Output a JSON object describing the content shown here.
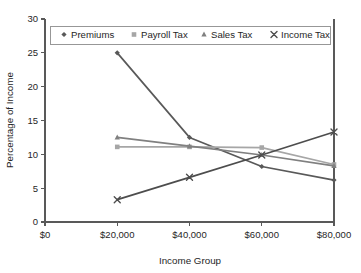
{
  "chart_data": {
    "type": "line",
    "title": "",
    "xlabel": "Income Group",
    "ylabel": "Percentage of Income",
    "x": [
      20000,
      40000,
      60000,
      80000
    ],
    "xtick_labels": [
      "$0",
      "$20,000",
      "$40,000",
      "$60,000",
      "$80,000"
    ],
    "xtick_values": [
      0,
      20000,
      40000,
      60000,
      80000
    ],
    "ytick_labels": [
      "0",
      "5",
      "10",
      "15",
      "20",
      "25",
      "30"
    ],
    "ytick_values": [
      0,
      5,
      10,
      15,
      20,
      25,
      30
    ],
    "xlim": [
      0,
      80000
    ],
    "ylim": [
      0,
      30
    ],
    "grid": false,
    "legend_position": "top-inside",
    "series": [
      {
        "name": "Premiums",
        "marker": "diamond",
        "color": "#595959",
        "values": [
          25.0,
          12.5,
          8.2,
          6.2
        ]
      },
      {
        "name": "Payroll Tax",
        "marker": "square",
        "color": "#a6a6a6",
        "values": [
          11.1,
          11.1,
          11.0,
          8.5
        ]
      },
      {
        "name": "Sales Tax",
        "marker": "triangle",
        "color": "#808080",
        "values": [
          12.5,
          11.2,
          9.9,
          8.3
        ]
      },
      {
        "name": "Income Tax",
        "marker": "cross",
        "color": "#4d4d4d",
        "values": [
          3.3,
          6.6,
          9.9,
          13.3
        ]
      }
    ]
  },
  "colors": {
    "axis": "#595959",
    "text": "#262626",
    "background": "#ffffff"
  }
}
